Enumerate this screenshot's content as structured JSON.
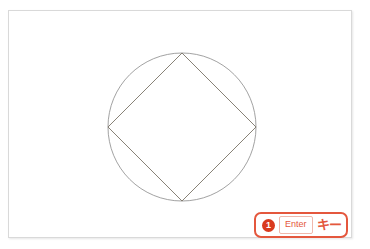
{
  "frame": {
    "border_color": "#d9d9d9",
    "background": "#ffffff"
  },
  "figure": {
    "title": "",
    "circle": {
      "name": "circumscribed-circle",
      "center_x": 173,
      "center_y": 116,
      "radius": 74,
      "stroke": "#8a8a8a",
      "stroke_width": 0.8,
      "fill": "none"
    },
    "diamond": {
      "name": "inscribed-square-rotated",
      "vertices": [
        {
          "label": "top",
          "x": 173,
          "y": 42
        },
        {
          "label": "right",
          "x": 247,
          "y": 116
        },
        {
          "label": "bottom",
          "x": 173,
          "y": 190
        },
        {
          "label": "left",
          "x": 99,
          "y": 116
        }
      ],
      "stroke": "#7b7468",
      "stroke_width": 0.9,
      "fill": "none"
    }
  },
  "callout": {
    "name": "enter-key-callout",
    "step_number": "1",
    "key_label": "Enter",
    "suffix_label": "キー",
    "accent_color": "#e4573d",
    "marker_color": "#d93a1e",
    "chip_border_color": "#f0b8ac"
  }
}
